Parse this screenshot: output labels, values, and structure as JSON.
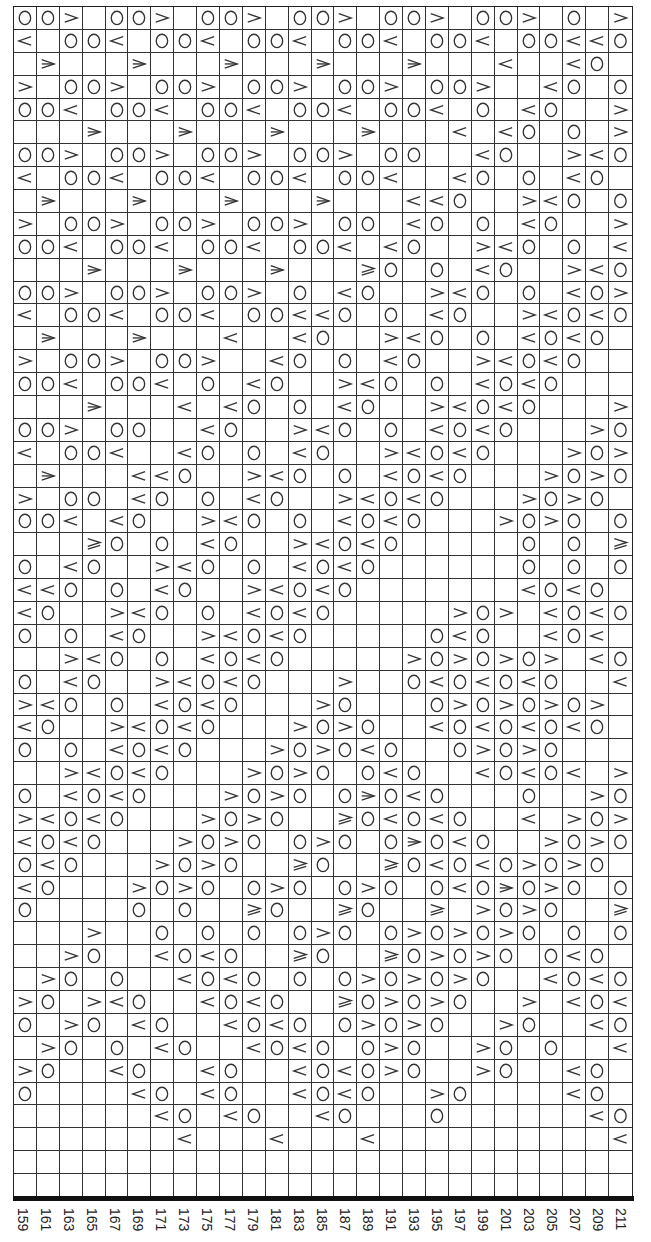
{
  "chart_data": {
    "type": "table",
    "title": "",
    "legend": {
      "O": "yarn-over",
      ">": "right-leaning-decrease",
      "<": "left-leaning-decrease",
      "D": "double-decrease",
      "T": "double-decrease-variant",
      "_": "blank"
    },
    "column_labels": [
      "159",
      "161",
      "163",
      "165",
      "167",
      "169",
      "171",
      "173",
      "175",
      "177",
      "179",
      "181",
      "183",
      "185",
      "187",
      "189",
      "191",
      "193",
      "195",
      "197",
      "199",
      "201",
      "203",
      "205",
      "207",
      "209",
      "211"
    ],
    "rows": [
      "OO>_OO>_OO>_OO>_OO>_OO>_O_>",
      "<_OO<_OO<_OO<_OO<_OO<_OO<<O",
      "_D___D___D___D___D___<__<O_",
      ">_OO>_OO>_OO>_OO>_OO>__<O_O",
      "OO<_OO<_OO<_OO<_OO<_O_<O__>",
      "___D___D___D___D___<_<O_O_>",
      "OO>_OO>_OO>_OO>_OO__<O__><O",
      "<_OO<_OO<_OO<_OO<__<O_O_<O_",
      "_D___D___D___D___<<O__><O_O",
      ">_OO>_OO>_OO>_OO_<O_O_<O__>",
      "OO<_OO<_OO<_OO<_<O__><O_O_<",
      "___D___D___D___TO_O_<O__><O",
      "OO>_OO>_OO>_O_<O__><O_O_<O>",
      "<_OO<_OO<_OO<<O_O_<O__><O<O",
      "_D___D___<__<O__><O_O_<O<O_",
      ">_OO>_OO>__<O_O_<O__><O<O__",
      "OO<_OO<_O_<O__><O_O_<O<O___",
      "___D___<_<O_O_<O__><O<O___>",
      "OO>_OO__<O__><O_O_<O<O___>O",
      "<_OO<__<O_O_<O__><O<O___>O>",
      "_D___<<O__><O_O_<O<O___>O>O",
      ">_OO_<O_O_<O__><O<O___>O>O_",
      "OO<_<O__><O_O_<O<O___>O>O_O",
      "___TO_O_<O__><O<O_____O_O_T",
      "O_<O__><O_O_<O<O______O_O_O",
      "<<O_O_<O__><O<O_______<O<O_",
      "<O__><O_O_<O<O_____>O>_<O<O",
      "O_O_<O__><O<O_____O<O__<O<",
      "__><O_O_<O<O_____>O>O>O>_<O",
      "O_<O__><O<O___>__O<O<O<O__<",
      "><O_O_<O<O___>O___O>O>O>O>_",
      "<O__><O<O___>O>O__<O<O<O<O_",
      "O_O_<O<O___>O>O<O__O>O>O___",
      "__><O<O___>O>O_O<O__<O<O<_>",
      "O_<O<O___>O>O_ODO<O___O__>O",
      "><O<O___>O>O__TO<O<O__<_>O>",
      "<O<O___>O>O_O>O_ODO<O__>O>O",
      "O<O___>O>O__TO__TO<O<O>O>O_",
      "<O___>O>O_O>O_O>O_O<ODO>O_O",
      "O____O_O__TO__TO__T_>O>O__T",
      "___>__O_O_O_O>O_O>O>O>O_O_O",
      "__>O__<O<O__TO__TO>O>O_O<O_",
      "_>O_O__<O<O_O_O>O>O>O__<O<O",
      ">O_><O__<O<O__TO>O>O__>_<O<",
      "O_>O_<O__<O<O_O>O>O__>O__<O",
      "_>O_O_<O__<O<O_O>O__>O_O__<",
      ">O__<O__<O__<O<O>O__>O__<O_",
      "O____<O_<O__<O<O__>O____<O_",
      "______<O_<O__<O___O______<O",
      "_______<___<___<__________<",
      "___________________________",
      "___________________________"
    ],
    "grid": {
      "columns": 27,
      "rows": 52,
      "gridlines": true
    },
    "xlabel": "",
    "ylabel": ""
  },
  "colors": {
    "line": "#333333",
    "symbol": "#333333",
    "background": "#ffffff"
  }
}
